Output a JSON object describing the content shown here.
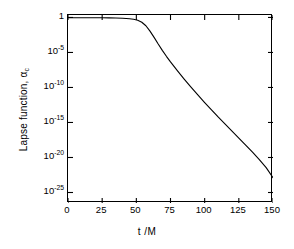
{
  "chart_data": {
    "type": "line",
    "title": "",
    "xlabel": "t /M",
    "ylabel": "Lapse function, α",
    "ylabel_sub": "c",
    "xlim": [
      0,
      150
    ],
    "ylim_exponent": [
      -26.5,
      0.35
    ],
    "grid": false,
    "legend": null,
    "yscale": "log",
    "xscale": "linear",
    "xticks": [
      0,
      25,
      50,
      75,
      100,
      125,
      150
    ],
    "xtick_labels": [
      "0",
      "25",
      "50",
      "75",
      "100",
      "125",
      "150"
    ],
    "ytick_exponents": [
      0,
      -5,
      -10,
      -15,
      -20,
      -25
    ],
    "ytick_labels": [
      "1",
      "10",
      "10",
      "10",
      "10",
      "10"
    ],
    "ytick_exponent_labels": [
      "",
      "-5",
      "-10",
      "-15",
      "-20",
      "-25"
    ],
    "series": [
      {
        "name": "lapse function",
        "color": "#000000",
        "x": [
          0,
          5,
          10,
          15,
          20,
          25,
          30,
          35,
          40,
          45,
          48,
          51,
          54,
          57,
          60,
          63,
          66,
          69,
          72,
          75,
          80,
          85,
          90,
          95,
          100,
          105,
          110,
          115,
          120,
          125,
          130,
          135,
          140,
          145,
          150
        ],
        "y_exponent": [
          -0.035,
          -0.036,
          -0.038,
          -0.041,
          -0.045,
          -0.052,
          -0.063,
          -0.082,
          -0.115,
          -0.185,
          -0.26,
          -0.4,
          -0.68,
          -1.18,
          -1.95,
          -2.85,
          -3.8,
          -4.7,
          -5.55,
          -6.35,
          -7.6,
          -8.8,
          -9.95,
          -11.05,
          -12.15,
          -13.2,
          -14.25,
          -15.25,
          -16.25,
          -17.25,
          -18.25,
          -19.25,
          -20.3,
          -21.45,
          -22.9
        ]
      }
    ]
  }
}
